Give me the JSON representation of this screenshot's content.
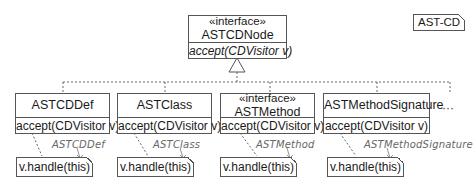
{
  "diagram_label": "AST-CD",
  "root": {
    "stereotype": "«interface»",
    "name": "ASTCDNode",
    "operation": "accept(CDVisitor v)"
  },
  "classes": [
    {
      "stereotype": "",
      "name": "ASTCDDef",
      "operation": "accept(CDVisitor v)",
      "note": "v.handle(this)",
      "note_tag": "ASTCDDef"
    },
    {
      "stereotype": "",
      "name": "ASTClass",
      "operation": "accept(CDVisitor v)",
      "note": "v.handle(this)",
      "note_tag": "ASTClass"
    },
    {
      "stereotype": "«interface»",
      "name": "ASTMethod",
      "operation": "accept(CDVisitor v)",
      "note": "v.handle(this)",
      "note_tag": "ASTMethod"
    },
    {
      "stereotype": "",
      "name": "ASTMethodSignature",
      "operation": "accept(CDVisitor v)",
      "note": "v.handle(this)",
      "note_tag": "ASTMethodSignature"
    }
  ],
  "more_indicator": "···",
  "colors": {
    "line": "#555555",
    "tag_text": "#666666"
  }
}
